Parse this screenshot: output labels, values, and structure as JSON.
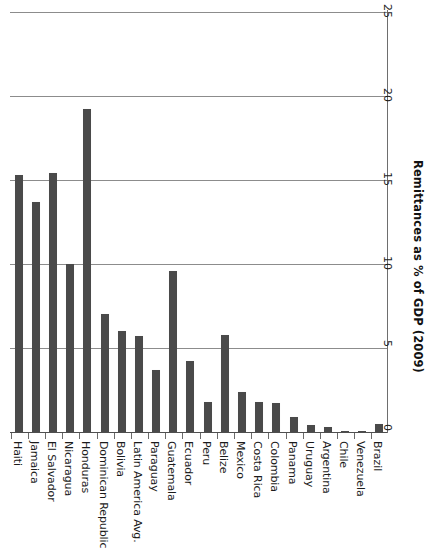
{
  "chart_data": {
    "type": "bar",
    "orientation": "vertical-rotated-90",
    "title": "",
    "xlabel": "",
    "ylabel": "Remittances as % of GDP (2009)",
    "ylim": [
      0,
      25
    ],
    "yticks": [
      0,
      5,
      10,
      15,
      20,
      25
    ],
    "grid": true,
    "legend": null,
    "series_color": "#4a4a4a",
    "categories": [
      "Haiti",
      "Jamaica",
      "El Salvador",
      "Nicaragua",
      "Honduras",
      "Dominican Republic",
      "Bolivia",
      "Latin America Avg.",
      "Paraguay",
      "Guatemala",
      "Ecuador",
      "Peru",
      "Belize",
      "Mexico",
      "Costa Rica",
      "Colombia",
      "Panama",
      "Uruguay",
      "Argentina",
      "Chile",
      "Venezuela",
      "Brazil"
    ],
    "values": [
      15.3,
      13.7,
      15.4,
      10.0,
      19.2,
      7.0,
      6.0,
      5.7,
      3.7,
      9.6,
      4.2,
      1.8,
      5.8,
      2.4,
      1.8,
      1.7,
      0.9,
      0.4,
      0.3,
      0.05,
      0.05,
      0.5
    ]
  },
  "axis": {
    "tick_labels": [
      "0",
      "5",
      "10",
      "15",
      "20",
      "25"
    ],
    "title": "Remittances as % of GDP (2009)"
  }
}
